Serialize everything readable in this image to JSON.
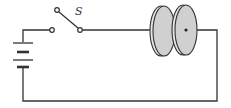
{
  "diagram": {
    "type": "circuit",
    "components": [
      {
        "id": "battery",
        "kind": "battery"
      },
      {
        "id": "switch",
        "kind": "switch",
        "label": "S",
        "state": "open"
      },
      {
        "id": "capacitor",
        "kind": "parallel-plate-capacitor",
        "plates": "circular disks"
      }
    ],
    "colors": {
      "wire": "#333333",
      "plate_fill": "#d0d0d0",
      "plate_edge": "#333333"
    }
  },
  "labels": {
    "switch": "S"
  }
}
